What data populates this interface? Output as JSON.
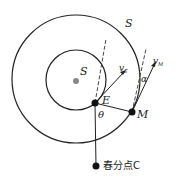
{
  "diagram": {
    "labels": {
      "outer_orbit": "S",
      "sun": "S",
      "earth": "E",
      "mars": "M",
      "earth_velocity": "v",
      "earth_velocity_sub": "E",
      "mars_velocity": "v",
      "mars_velocity_sub": "M",
      "angle_theta": "θ",
      "angle_alpha": "α",
      "vernal_equinox": "春分点C"
    },
    "colors": {
      "line": "#222222",
      "sun": "#888888",
      "point": "#111111"
    }
  }
}
